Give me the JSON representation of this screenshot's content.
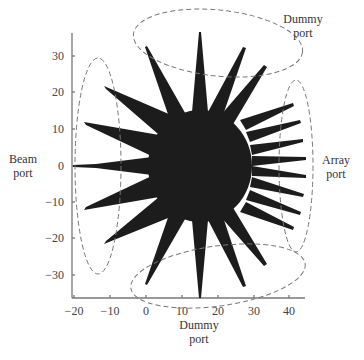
{
  "figure": {
    "type": "rotman-lens-port-diagram",
    "fill_color": "#1c1c1c",
    "axis_color": "#777777",
    "ellipse_color": "#777777"
  },
  "labels": {
    "beam_port": [
      "Beam",
      "port"
    ],
    "array_port": [
      "Array",
      "port"
    ],
    "dummy_port_top": [
      "Dummy",
      "port"
    ],
    "dummy_port_bottom": [
      "Dummy",
      "port"
    ]
  },
  "axes": {
    "x_ticks": [
      "−20",
      "−10",
      "0",
      "10",
      "20",
      "30",
      "40"
    ],
    "y_ticks": [
      "30",
      "20",
      "10",
      "0",
      "−10",
      "−20",
      "−30"
    ],
    "xlim": [
      -20,
      45
    ],
    "ylim": [
      -37,
      37
    ]
  },
  "ports": {
    "beam_port_count": 5,
    "array_port_count": 8,
    "dummy_port_top_count": 4,
    "dummy_port_bottom_count": 4
  }
}
